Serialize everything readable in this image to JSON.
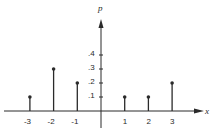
{
  "chart_data": {
    "type": "stem",
    "title": "",
    "xlabel": "x",
    "ylabel": "p",
    "x": [
      -3,
      -2,
      -1,
      1,
      2,
      3
    ],
    "values": [
      0.1,
      0.3,
      0.2,
      0.1,
      0.1,
      0.2
    ],
    "x_ticks": [
      "-3",
      "-2",
      "-1",
      "1",
      "2",
      "3"
    ],
    "y_ticks": [
      ".1",
      ".2",
      ".3",
      ".4"
    ],
    "y_tick_values": [
      0.1,
      0.2,
      0.3,
      0.4
    ],
    "xlim": [
      -4,
      4
    ],
    "ylim": [
      0,
      0.65
    ],
    "grid": false,
    "legend": null
  },
  "colors": {
    "ink": "#2a2a2a",
    "background": "#ffffff"
  }
}
